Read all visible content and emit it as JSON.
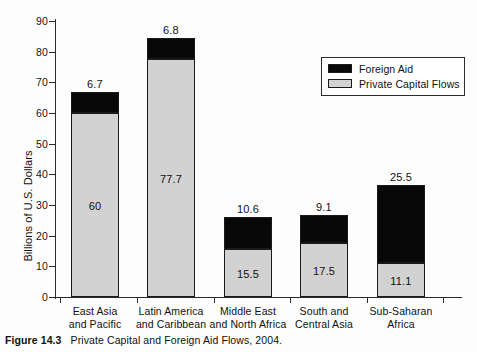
{
  "chart_data": {
    "type": "bar",
    "subtype": "stacked-vertical",
    "title": "",
    "xlabel": "",
    "ylabel": "Billions of U.S. Dollars",
    "ylim": [
      0,
      90
    ],
    "ytick_labels": [
      "90",
      "80",
      "70",
      "60",
      "50",
      "40",
      "30",
      "20",
      "10",
      "0"
    ],
    "ytick_values": [
      90,
      80,
      70,
      60,
      50,
      40,
      30,
      20,
      10,
      0
    ],
    "grid": false,
    "legend_position": "top-right",
    "categories": [
      "East Asia and Pacific",
      "Latin America and Caribbean",
      "Middle East and North Africa",
      "South and Central Asia",
      "Sub-Saharan Africa"
    ],
    "category_lines": [
      [
        "East Asia",
        "and Pacific"
      ],
      [
        "Latin America",
        "and Caribbean"
      ],
      [
        "Middle East",
        "and North Africa"
      ],
      [
        "South and",
        "Central Asia"
      ],
      [
        "Sub-Saharan",
        "Africa"
      ]
    ],
    "series": [
      {
        "name": "Private Capital Flows",
        "color": "#d2d2d2",
        "values": [
          60,
          77.7,
          15.5,
          17.5,
          11.1
        ],
        "value_labels": [
          "60",
          "77.7",
          "15.5",
          "17.5",
          "11.1"
        ]
      },
      {
        "name": "Foreign Aid",
        "color": "#080808",
        "values": [
          6.7,
          6.8,
          10.6,
          9.1,
          25.5
        ],
        "value_labels": [
          "6.7",
          "6.8",
          "10.6",
          "9.1",
          "25.5"
        ]
      }
    ],
    "totals": [
      66.7,
      84.5,
      26.1,
      26.6,
      36.6
    ]
  },
  "legend": {
    "items": [
      {
        "label": "Foreign Aid",
        "color": "#080808"
      },
      {
        "label": "Private Capital Flows",
        "color": "#d2d2d2"
      }
    ]
  },
  "caption": {
    "figure_label": "Figure 14.3",
    "text": "Private Capital and Foreign Aid Flows, 2004."
  }
}
